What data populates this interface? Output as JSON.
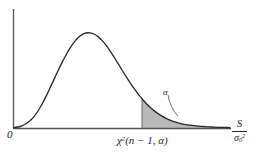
{
  "figure": {
    "title": "",
    "origin_label": "0",
    "alpha_label": "α",
    "x_critical_label_parts": {
      "chi": "χ",
      "chi_exponent": "2",
      "args": "(n − 1, α)"
    },
    "axis_label_parts": {
      "numerator": "S",
      "denominator_base": "σ",
      "denominator_sub": "0",
      "denominator_sup": "2"
    },
    "colors": {
      "curve": "#2a2a2a",
      "axis": "#555555",
      "shade_fill": "#b9b9b9",
      "shade_edge": "#6a6a6a",
      "background": "#ffffff",
      "text": "#2a2a2a"
    }
  },
  "chart_data": {
    "type": "line",
    "xlabel": "S/σ₀²",
    "ylabel": "",
    "grid": false,
    "legend": null,
    "axis_origin_tick": "0",
    "annotations": [
      {
        "text": "α",
        "role": "tail-area-label",
        "x": 176,
        "y": 114,
        "leader_from": [
          168,
          95
        ],
        "leader_to": [
          178,
          116
        ]
      },
      {
        "text": "χ²(n − 1, α)",
        "role": "critical-value-label",
        "x": 142,
        "y": 128
      },
      {
        "text": "S/σ₀²",
        "role": "x-axis-name",
        "x": 238,
        "y": 128
      }
    ],
    "axis_ranges": {
      "x_pixels": [
        13,
        230
      ],
      "y_pixels_baseline": 128,
      "y_pixels_top": 9
    },
    "critical_value_x_pixel": 142,
    "shaded_region": {
      "from_x_pixel": 142,
      "to_x_pixel": 230,
      "label": "α",
      "fill": "#b9b9b9"
    },
    "curve_points": [
      [
        14,
        127.6
      ],
      [
        18,
        127.0
      ],
      [
        22,
        125.8
      ],
      [
        26,
        123.8
      ],
      [
        30,
        120.8
      ],
      [
        34,
        116.6
      ],
      [
        38,
        111.0
      ],
      [
        42,
        104.2
      ],
      [
        46,
        96.4
      ],
      [
        50,
        88.0
      ],
      [
        54,
        79.4
      ],
      [
        58,
        70.8
      ],
      [
        62,
        62.6
      ],
      [
        66,
        55.0
      ],
      [
        70,
        48.2
      ],
      [
        74,
        42.4
      ],
      [
        78,
        37.8
      ],
      [
        82,
        34.6
      ],
      [
        86,
        33.0
      ],
      [
        90,
        32.8
      ],
      [
        94,
        34.0
      ],
      [
        98,
        36.6
      ],
      [
        102,
        40.4
      ],
      [
        106,
        45.2
      ],
      [
        110,
        50.8
      ],
      [
        114,
        57.0
      ],
      [
        118,
        63.4
      ],
      [
        122,
        70.0
      ],
      [
        126,
        76.4
      ],
      [
        130,
        82.6
      ],
      [
        134,
        88.4
      ],
      [
        138,
        93.8
      ],
      [
        142,
        98.8
      ],
      [
        146,
        103.2
      ],
      [
        150,
        107.2
      ],
      [
        154,
        110.6
      ],
      [
        158,
        113.6
      ],
      [
        162,
        116.2
      ],
      [
        166,
        118.4
      ],
      [
        170,
        120.2
      ],
      [
        174,
        121.6
      ],
      [
        178,
        122.8
      ],
      [
        182,
        123.8
      ],
      [
        186,
        124.6
      ],
      [
        190,
        125.2
      ],
      [
        194,
        125.7
      ],
      [
        198,
        126.1
      ],
      [
        202,
        126.4
      ],
      [
        206,
        126.7
      ],
      [
        210,
        126.9
      ],
      [
        214,
        127.1
      ],
      [
        218,
        127.3
      ],
      [
        222,
        127.4
      ],
      [
        226,
        127.5
      ],
      [
        230,
        127.6
      ]
    ]
  }
}
